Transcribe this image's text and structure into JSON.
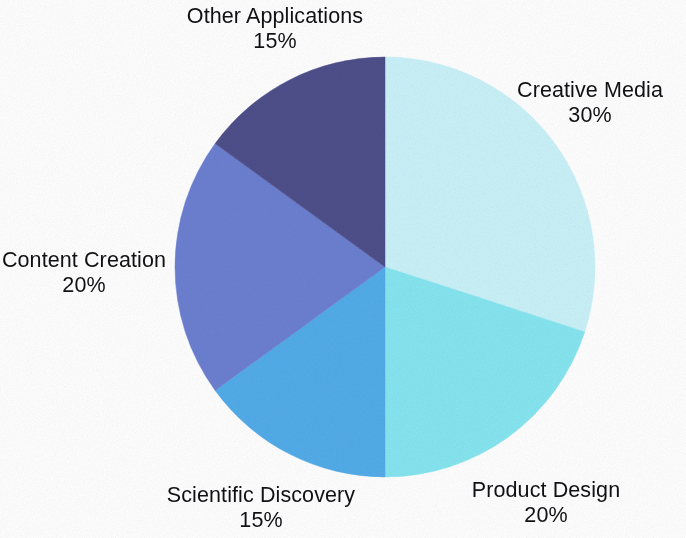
{
  "chart_data": {
    "type": "pie",
    "title": "",
    "subtitle": "",
    "xlabel": "",
    "ylabel": "",
    "legend_position": "none",
    "grid": false,
    "label_format": "name above percent",
    "start_angle_deg": 0,
    "direction": "clockwise",
    "background_color": "#ffffff",
    "label_text_color": "#111115",
    "categories": [
      "Creative Media",
      "Product Design",
      "Scientific Discovery",
      "Content Creation",
      "Other Applications"
    ],
    "values": [
      30,
      20,
      15,
      20,
      15
    ],
    "value_labels": [
      "30%",
      "20%",
      "15%",
      "20%",
      "15%"
    ],
    "colors": [
      "#c9f2f8",
      "#86e6f1",
      "#52ace9",
      "#6c80d1",
      "#4e4f8a"
    ],
    "slices": [
      {
        "name": "Creative Media",
        "value": 30,
        "value_label": "30%",
        "color": "#c9f2f8",
        "start_angle_deg": 0,
        "end_angle_deg": 108
      },
      {
        "name": "Product Design",
        "value": 20,
        "value_label": "20%",
        "color": "#86e6f1",
        "start_angle_deg": 108,
        "end_angle_deg": 180
      },
      {
        "name": "Scientific Discovery",
        "value": 15,
        "value_label": "15%",
        "color": "#52ace9",
        "start_angle_deg": 180,
        "end_angle_deg": 234
      },
      {
        "name": "Content Creation",
        "value": 20,
        "value_label": "20%",
        "color": "#6c80d1",
        "start_angle_deg": 234,
        "end_angle_deg": 306
      },
      {
        "name": "Other Applications",
        "value": 15,
        "value_label": "15%",
        "color": "#4e4f8a",
        "start_angle_deg": 306,
        "end_angle_deg": 360
      }
    ]
  },
  "labels": {
    "creative_media": {
      "name": "Creative Media",
      "value": "30%"
    },
    "product_design": {
      "name": "Product Design",
      "value": "20%"
    },
    "scientific_discovery": {
      "name": "Scientific Discovery",
      "value": "15%"
    },
    "content_creation": {
      "name": "Content Creation",
      "value": "20%"
    },
    "other_applications": {
      "name": "Other Applications",
      "value": "15%"
    }
  }
}
